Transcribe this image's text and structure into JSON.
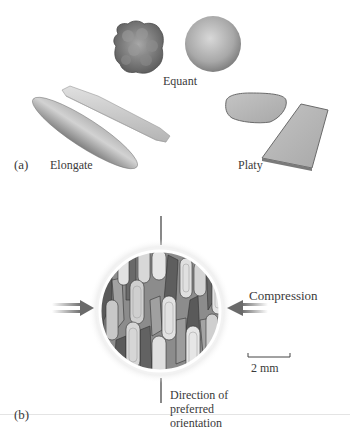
{
  "panel_a": {
    "label": "(a)",
    "groups": [
      {
        "name": "Equant",
        "shapes": [
          "irregular-lumpy-grain",
          "sphere"
        ]
      },
      {
        "name": "Elongate",
        "shapes": [
          "ellipsoid-rod",
          "prismatic-rod"
        ]
      },
      {
        "name": "Platy",
        "shapes": [
          "rounded-plate",
          "rectangular-plate"
        ]
      }
    ]
  },
  "panel_b": {
    "label": "(b)",
    "compression_label": "Compression",
    "scale_bar_label": "2 mm",
    "orientation_label_line1": "Direction of",
    "orientation_label_line2": "preferred",
    "orientation_label_line3": "orientation",
    "colors": {
      "grain_dark": "#5a5a5a",
      "grain_mid": "#8c8c8c",
      "grain_light": "#c8c8c8",
      "grain_lightest": "#e6e6e6",
      "arrow": "#6e6e6e"
    }
  }
}
